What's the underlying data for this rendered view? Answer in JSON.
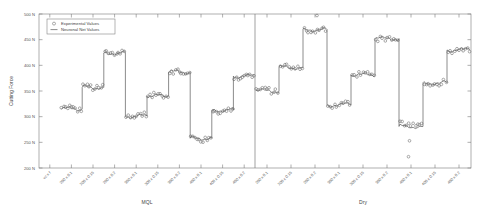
{
  "chart_data": {
    "type": "line",
    "title": "",
    "xlabel": "",
    "ylabel": "Cutting Force",
    "ylim": [
      200,
      500
    ],
    "yticks": [
      200,
      250,
      300,
      350,
      400,
      450,
      500
    ],
    "ytick_labels": [
      "200 N",
      "250 N",
      "300 N",
      "350 N",
      "400 N",
      "450 N",
      "500 N"
    ],
    "grid": false,
    "legend_position": "top-left",
    "legend": [
      {
        "name": "Experimental Values",
        "marker": "circle",
        "style": "open-circle"
      },
      {
        "name": "Neuronal Net Values",
        "marker": "line",
        "style": "solid-line"
      }
    ],
    "axis_variable_label": "vc x f",
    "groups": [
      {
        "name": "MQL",
        "categories": [
          "200 x 0.1",
          "200 x 0.15",
          "200 x 0.2",
          "300 x 0.1",
          "300 x 0.15",
          "300 x 0.2",
          "400 x 0.1",
          "400 x 0.15",
          "400 x 0.2"
        ],
        "series": [
          {
            "name": "Neuronal Net Values",
            "values": [
              315,
              357,
              424,
              301,
              340,
              387,
              258,
              313,
              379
            ]
          },
          {
            "name": "Experimental Values",
            "values": [
              316,
              358,
              425,
              302,
              341,
              386,
              257,
              312,
              378
            ]
          }
        ]
      },
      {
        "name": "Dry",
        "categories": [
          "200 x 0.1",
          "200 x 0.15",
          "200 x 0.2",
          "300 x 0.1",
          "300 x 0.15",
          "300 x 0.2",
          "400 x 0.1",
          "400 x 0.15",
          "400 x 0.2"
        ],
        "series": [
          {
            "name": "Neuronal Net Values",
            "values": [
              350,
              396,
              470,
              323,
              381,
              452,
              281,
              366,
              430
            ]
          },
          {
            "name": "Experimental Values",
            "values": [
              351,
              397,
              468,
              324,
              382,
              450,
              285,
              365,
              431
            ]
          }
        ]
      }
    ],
    "colors": {
      "line": "#4d4d4d",
      "marker": "#666666",
      "axis": "#7a7a7a",
      "text": "#555555",
      "background": "#ffffff"
    }
  }
}
